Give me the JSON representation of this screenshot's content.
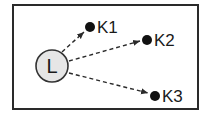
{
  "diagram": {
    "center_node": {
      "label": "L",
      "fill": "#e6e6e6",
      "stroke": "#333333"
    },
    "targets": [
      {
        "label": "K1"
      },
      {
        "label": "K2"
      },
      {
        "label": "K3"
      }
    ],
    "edge_style": "dashed-arrow",
    "colors": {
      "border": "#2a2a2a",
      "ink": "#1a1a1a"
    }
  }
}
